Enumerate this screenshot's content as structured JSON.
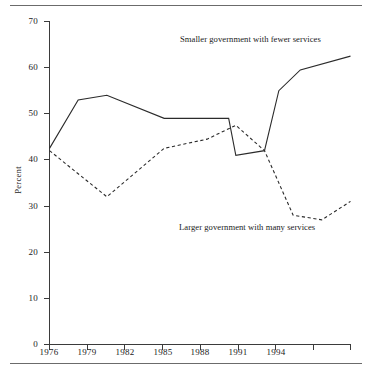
{
  "figure": {
    "name": "attitudes-toward-size-of-government-line-chart",
    "has_top_rule": true,
    "has_bottom_rule": true
  },
  "axes": {
    "y_label": "Percent",
    "y_ticks": [
      "0",
      "10",
      "20",
      "30",
      "40",
      "50",
      "60",
      "70"
    ],
    "y_tick_values": [
      0,
      10,
      20,
      30,
      40,
      50,
      60,
      70
    ],
    "y_min": 0,
    "y_max": 70,
    "x_ticks": [
      "1976",
      "1979",
      "1982",
      "1985",
      "1988",
      "1991",
      "1994"
    ],
    "x_tick_values": [
      1976,
      1979,
      1982,
      1985,
      1988,
      1991,
      1994
    ],
    "x_min": 1976,
    "x_max": 1997,
    "x_unlabeled_tick_value": 1997
  },
  "annotations": {
    "smaller": "Smaller government with fewer services",
    "larger": "Larger government with many services"
  },
  "colors": {
    "line": "#2b2b2b",
    "axis": "#3b3b3b",
    "rule": "#6b6b6b",
    "background": "#ffffff",
    "text": "#1a1a1a"
  },
  "chart_data": {
    "type": "line",
    "title": "",
    "subtitle": "",
    "xlabel": "",
    "ylabel": "Percent",
    "xlim": [
      1976,
      1997
    ],
    "ylim": [
      0,
      70
    ],
    "grid": false,
    "legend": "inline-annotations",
    "tick_labels": {
      "x": [
        "1976",
        "1979",
        "1982",
        "1985",
        "1988",
        "1991",
        "1994"
      ],
      "y": [
        "0",
        "10",
        "20",
        "30",
        "40",
        "50",
        "60",
        "70"
      ]
    },
    "series": [
      {
        "name": "Smaller government with fewer services",
        "style": "solid",
        "x": [
          1976,
          1978,
          1980,
          1984,
          1988.5,
          1989,
          1991,
          1992,
          1993.5,
          1997
        ],
        "values": [
          42.5,
          53.0,
          54.0,
          49.0,
          49.0,
          41.0,
          42.0,
          55.0,
          59.5,
          62.5
        ]
      },
      {
        "name": "Larger government with many services",
        "style": "dashed",
        "x": [
          1976,
          1980,
          1984,
          1987,
          1989,
          1991,
          1993,
          1995,
          1997
        ],
        "values": [
          42.0,
          32.0,
          42.5,
          44.5,
          47.5,
          42.0,
          28.0,
          27.0,
          31.0
        ]
      }
    ]
  }
}
